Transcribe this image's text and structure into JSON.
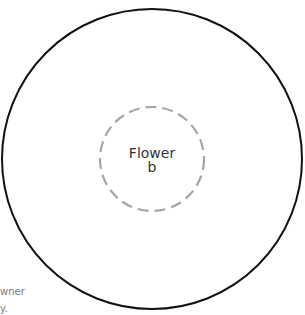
{
  "diagram": {
    "outer_circle": {
      "cx": 152,
      "cy": 159,
      "r": 150,
      "stroke": "#111111",
      "style": "solid"
    },
    "inner_circle": {
      "cx": 152,
      "cy": 159,
      "r": 52,
      "stroke": "#a6a6a6",
      "style": "dashed"
    },
    "center_label": {
      "line1": "Flower",
      "line2": "b"
    },
    "clipped_text": {
      "line1": "wner",
      "line2": "y."
    }
  }
}
